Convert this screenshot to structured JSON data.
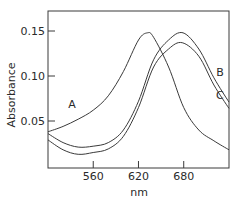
{
  "chart_data": {
    "type": "line",
    "title": "",
    "xlabel": "nm",
    "ylabel": "Absorbance",
    "xlim": [
      500,
      740
    ],
    "ylim": [
      0,
      0.165
    ],
    "grid": false,
    "legend": "inline labels",
    "xticks": [
      560,
      620,
      680
    ],
    "xtick_labels": [
      "560",
      "620",
      "680"
    ],
    "yticks": [
      0.05,
      0.1,
      0.15
    ],
    "ytick_labels": [
      "0.05",
      "0.10",
      "0.15"
    ],
    "series": [
      {
        "name": "A",
        "x": [
          500,
          520,
          540,
          560,
          580,
          600,
          620,
          632,
          640,
          660,
          680,
          700,
          720,
          740
        ],
        "values": [
          0.038,
          0.044,
          0.052,
          0.062,
          0.078,
          0.105,
          0.14,
          0.148,
          0.143,
          0.11,
          0.065,
          0.04,
          0.028,
          0.018
        ]
      },
      {
        "name": "B",
        "x": [
          500,
          520,
          540,
          560,
          580,
          600,
          620,
          640,
          660,
          679,
          700,
          720,
          740
        ],
        "values": [
          0.036,
          0.026,
          0.021,
          0.022,
          0.026,
          0.04,
          0.072,
          0.118,
          0.14,
          0.148,
          0.13,
          0.098,
          0.071
        ]
      },
      {
        "name": "C",
        "x": [
          500,
          520,
          540,
          560,
          580,
          600,
          620,
          640,
          660,
          678,
          700,
          720,
          740
        ],
        "values": [
          0.029,
          0.018,
          0.013,
          0.015,
          0.019,
          0.033,
          0.065,
          0.11,
          0.13,
          0.137,
          0.122,
          0.09,
          0.064
        ]
      }
    ],
    "annotations": [
      {
        "text": "A",
        "x": 532,
        "y": 0.065
      },
      {
        "text": "B",
        "x": 728,
        "y": 0.1
      },
      {
        "text": "C",
        "x": 728,
        "y": 0.075
      }
    ]
  }
}
